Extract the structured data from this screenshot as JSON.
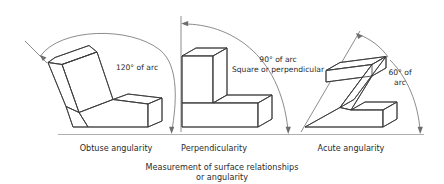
{
  "figure": {
    "caption_line1": "Measurement of surface relationships",
    "caption_line2": "or angularity",
    "baseline_color": "#9a9a9a",
    "edge_color": "#3a3a3a",
    "text_color": "#2b2b2b",
    "background_color": "#ffffff"
  },
  "panels": [
    {
      "id": "obtuse",
      "label": "Obtuse angularity",
      "annotation_line1": "120° of arc",
      "annotation_line2": "",
      "angle_degrees": 120,
      "shape": "stepped-block-obtuse"
    },
    {
      "id": "perpendicular",
      "label": "Perpendicularity",
      "annotation_line1": "90° of arc",
      "annotation_line2": "Square or perpendicular",
      "angle_degrees": 90,
      "shape": "stepped-block-L"
    },
    {
      "id": "acute",
      "label": "Acute angularity",
      "annotation_line1": "60° of",
      "annotation_line2": "arc",
      "angle_degrees": 60,
      "shape": "stepped-block-acute"
    }
  ]
}
